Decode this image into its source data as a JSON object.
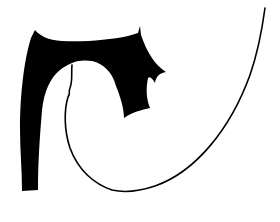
{
  "image": {
    "description": "Black ink silhouette drawing: a bent, arch-like dark form with a claw-like right end, plus a thin curving line sweeping from inside the arch down and up to the upper right.",
    "width": 280,
    "height": 222
  },
  "colors": {
    "background": "#ffffff",
    "ink": "#000000"
  },
  "shapes": [
    {
      "name": "arch-silhouette",
      "kind": "filled"
    },
    {
      "name": "curved-line",
      "kind": "stroke"
    }
  ]
}
